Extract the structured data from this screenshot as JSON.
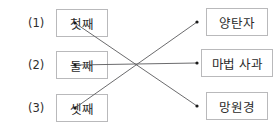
{
  "question_number": "4.",
  "left_column": {
    "items": [
      {
        "label": "(1)",
        "text": "첫째",
        "x": 28,
        "y": 9,
        "box_x": 56,
        "box_y": 9,
        "dot_x": 75,
        "dot_y": 23
      },
      {
        "label": "(2)",
        "text": "둘째",
        "x": 28,
        "y": 51,
        "box_x": 56,
        "box_y": 51,
        "dot_x": 75,
        "dot_y": 65
      },
      {
        "label": "(3)",
        "text": "셋째",
        "x": 28,
        "y": 94,
        "box_x": 56,
        "box_y": 94,
        "dot_x": 75,
        "dot_y": 108
      }
    ]
  },
  "right_column": {
    "items": [
      {
        "text": "양탄자",
        "box_x": 206,
        "box_y": 8,
        "dot_x": 197,
        "dot_y": 22
      },
      {
        "text": "마법 사과",
        "box_x": 201,
        "box_y": 49,
        "dot_x": 197,
        "dot_y": 63
      },
      {
        "text": "망원경",
        "box_x": 206,
        "box_y": 92,
        "dot_x": 197,
        "dot_y": 106
      }
    ]
  },
  "connections": [
    {
      "name": "first-to-telescope",
      "from_x": 75,
      "from_y": 23,
      "to_x": 197,
      "to_y": 106
    },
    {
      "name": "second-to-apple",
      "from_x": 75,
      "from_y": 65,
      "to_x": 197,
      "to_y": 63
    },
    {
      "name": "third-to-carpet",
      "from_x": 75,
      "from_y": 108,
      "to_x": 197,
      "to_y": 22
    }
  ],
  "colors": {
    "box_border": "#b9b9bb",
    "line": "#5a5a5c",
    "dot": "#1a1a1a",
    "text": "#2b2b2b",
    "background": "#ffffff"
  }
}
